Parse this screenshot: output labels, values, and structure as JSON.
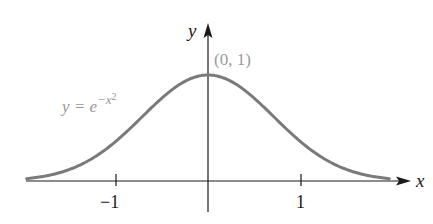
{
  "figure": {
    "x_axis_label": "x",
    "y_axis_label": "y",
    "tick_labels": [
      "−1",
      "1"
    ],
    "point_label": "(0, 1)",
    "curve_label_lhs": "y = e",
    "curve_label_exp": "−x",
    "curve_label_exp2": "2",
    "curve_color": "#7a7a7a",
    "axis_color": "#1a1a1a"
  },
  "chart_data": {
    "type": "line",
    "title": "",
    "function": "y = e^(-x^2)",
    "xlabel": "x",
    "ylabel": "y",
    "xlim": [
      -2.0,
      2.0
    ],
    "ylim": [
      0,
      1.4
    ],
    "x_ticks": [
      -1,
      1
    ],
    "annotations": [
      {
        "text": "(0, 1)",
        "x": 0,
        "y": 1
      },
      {
        "text": "y = e^{-x^2}",
        "x": -1.3,
        "y": 0.6
      }
    ],
    "x": [
      -1.95,
      -1.5,
      -1.0,
      -0.5,
      0,
      0.5,
      1.0,
      1.5,
      1.95
    ],
    "values": [
      0.022,
      0.105,
      0.368,
      0.779,
      1.0,
      0.779,
      0.368,
      0.105,
      0.022
    ],
    "grid": false
  }
}
